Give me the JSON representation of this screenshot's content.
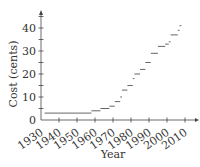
{
  "chart_data": {
    "type": "line",
    "style": "step",
    "title": "",
    "xlabel": "Year",
    "ylabel": "Cost (cents)",
    "xlim": [
      1930,
      2012
    ],
    "ylim": [
      0,
      45
    ],
    "x_ticks": [
      1930,
      1940,
      1950,
      1960,
      1970,
      1980,
      1990,
      2000,
      2010
    ],
    "y_ticks": [
      0,
      10,
      20,
      30,
      40
    ],
    "grid": false,
    "legend": null,
    "series": [
      {
        "name": "Cost",
        "steps": [
          {
            "start": 1932,
            "end": 1958,
            "value": 3
          },
          {
            "start": 1958,
            "end": 1963,
            "value": 4
          },
          {
            "start": 1963,
            "end": 1968,
            "value": 5
          },
          {
            "start": 1968,
            "end": 1971,
            "value": 6
          },
          {
            "start": 1971,
            "end": 1974,
            "value": 8
          },
          {
            "start": 1974,
            "end": 1975,
            "value": 10
          },
          {
            "start": 1975,
            "end": 1978,
            "value": 13
          },
          {
            "start": 1978,
            "end": 1981,
            "value": 15
          },
          {
            "start": 1981,
            "end": 1981.9,
            "value": 18
          },
          {
            "start": 1981.9,
            "end": 1985,
            "value": 20
          },
          {
            "start": 1985,
            "end": 1988,
            "value": 22
          },
          {
            "start": 1988,
            "end": 1991,
            "value": 25
          },
          {
            "start": 1991,
            "end": 1995,
            "value": 29
          },
          {
            "start": 1995,
            "end": 1999,
            "value": 32
          },
          {
            "start": 1999,
            "end": 2001,
            "value": 33
          },
          {
            "start": 2001,
            "end": 2002,
            "value": 34
          },
          {
            "start": 2002,
            "end": 2006,
            "value": 37
          },
          {
            "start": 2006,
            "end": 2007,
            "value": 39
          },
          {
            "start": 2007,
            "end": 2008,
            "value": 41
          }
        ]
      }
    ]
  }
}
